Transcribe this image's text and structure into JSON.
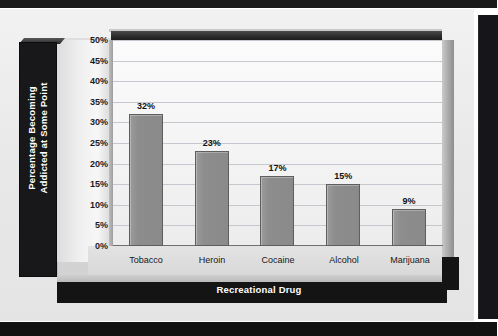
{
  "chart_data": {
    "type": "bar",
    "title": "",
    "xlabel": "Recreational Drug",
    "ylabel": "Percentage Becoming\nAddicted at Some Point",
    "categories": [
      "Tobacco",
      "Heroin",
      "Cocaine",
      "Alcohol",
      "Marijuana"
    ],
    "values": [
      32,
      23,
      17,
      15,
      9
    ],
    "data_labels": [
      "32%",
      "23%",
      "17%",
      "15%",
      "9%"
    ],
    "ylim": [
      0,
      50
    ],
    "ytick_step": 5,
    "ytick_labels": [
      "50%",
      "45%",
      "40%",
      "35%",
      "30%",
      "25%",
      "20%",
      "15%",
      "10%",
      "5%",
      "0%"
    ],
    "grid": true,
    "legend": "none",
    "series": [
      {
        "name": "Percentage Becoming Addicted at Some Point",
        "values": [
          32,
          23,
          17,
          15,
          9
        ]
      }
    ],
    "colors": {
      "bar_fill": "#8d8d8d",
      "bar_border": "#5e5e5e",
      "plot_background": "#f7f7f7",
      "gridline": "#c7c7cf",
      "axis_panel": "#18181a",
      "axis_text": "#ffffff",
      "page_background": "#e9e9e9"
    }
  }
}
